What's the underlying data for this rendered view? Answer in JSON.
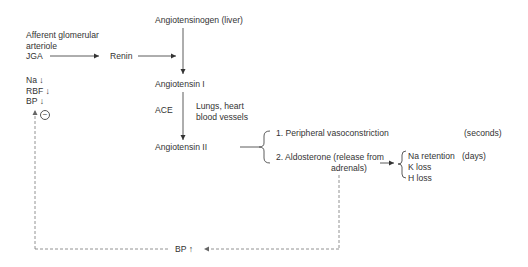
{
  "nodes": {
    "afferent_line1": "Afferent glomerular",
    "afferent_line2": "arteriole",
    "jga": "JGA",
    "renin": "Renin",
    "angiotensinogen": "Angiotensinogen (liver)",
    "angiotensin_1": "Angiotensin I",
    "ace": "ACE",
    "ace_site_line1": "Lungs, heart",
    "ace_site_line2": "blood vessels",
    "angiotensin_2": "Angiotensin II",
    "stimulus_na": "Na ↓",
    "stimulus_rbf": "RBF ↓",
    "stimulus_bp": "BP ↓",
    "inhibition": "−",
    "effect_1": "1.  Peripheral vasoconstriction",
    "effect_1_time": "(seconds)",
    "effect_2_line1": "2.  Aldosterone (release from",
    "effect_2_line2": "adrenals)",
    "aldo_effect_1": "Na retention",
    "aldo_effect_1_time": "(days)",
    "aldo_effect_2": "K loss",
    "aldo_effect_3": "H loss",
    "result": "BP ↑"
  },
  "colors": {
    "line": "#333333",
    "dashed": "#777777",
    "text": "#333333"
  }
}
